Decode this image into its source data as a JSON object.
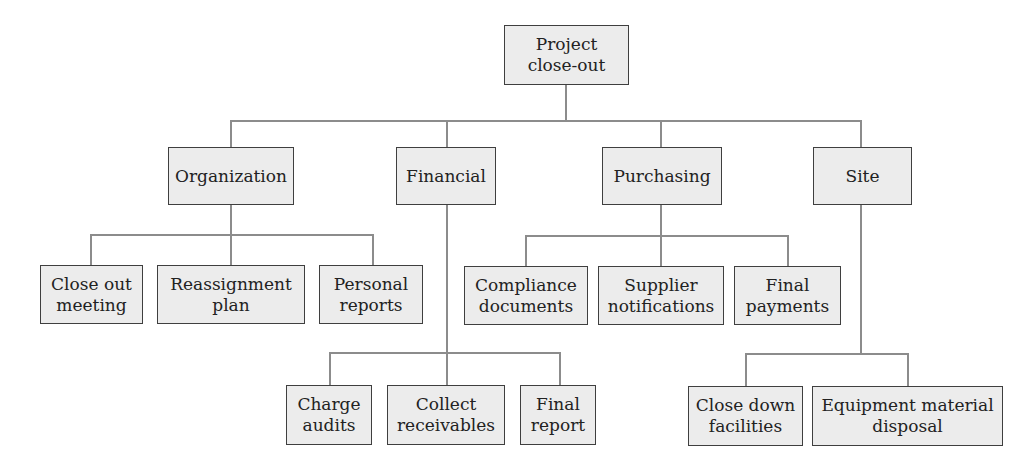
{
  "diagram": {
    "type": "hierarchy-tree",
    "root": {
      "label": "Project\nclose-out",
      "children": [
        {
          "label": "Organization",
          "children": [
            {
              "label": "Close out\nmeeting"
            },
            {
              "label": "Reassignment\nplan"
            },
            {
              "label": "Personal\nreports"
            }
          ]
        },
        {
          "label": "Financial",
          "children": [
            {
              "label": "Charge\naudits"
            },
            {
              "label": "Collect\nreceivables"
            },
            {
              "label": "Final\nreport"
            }
          ]
        },
        {
          "label": "Purchasing",
          "children": [
            {
              "label": "Compliance\ndocuments"
            },
            {
              "label": "Supplier\nnotifications"
            },
            {
              "label": "Final\npayments"
            }
          ]
        },
        {
          "label": "Site",
          "children": [
            {
              "label": "Close down\nfacilities"
            },
            {
              "label": "Equipment material\ndisposal"
            }
          ]
        }
      ]
    }
  },
  "colors": {
    "node_fill": "#ececec",
    "node_border": "#3f3f3f",
    "connector": "#8c8c8c",
    "text": "#222222",
    "background": "#ffffff"
  }
}
